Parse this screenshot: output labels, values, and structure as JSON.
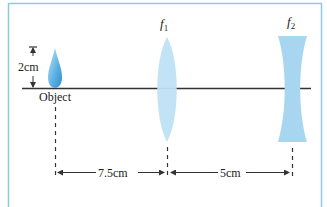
{
  "diagram": {
    "colors": {
      "frame": "#8ccbe4",
      "axis": "#333333",
      "lens_fill": "#bfe2f4",
      "lens2_fill": "#a8d6f0",
      "object_fill": "#5aaee0",
      "text": "#222222"
    },
    "height_marker": {
      "label": "2cm"
    },
    "object": {
      "label": "Object"
    },
    "lens1": {
      "label": "f",
      "subscript": "1"
    },
    "lens2": {
      "label": "f",
      "subscript": "2"
    },
    "distances": [
      {
        "label": "7.5cm",
        "from": "Object",
        "to": "f1"
      },
      {
        "label": "5cm",
        "from": "f1",
        "to": "f2"
      }
    ]
  }
}
